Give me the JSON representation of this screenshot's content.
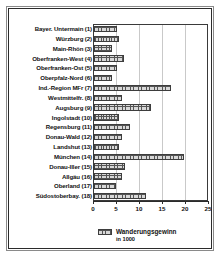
{
  "chart_data": {
    "type": "bar",
    "orientation": "horizontal",
    "title": "",
    "xlabel": "",
    "ylabel": "",
    "xlim": [
      0,
      25
    ],
    "xticks": [
      "0",
      "5",
      "10",
      "15",
      "20",
      "25"
    ],
    "grid": true,
    "legend": {
      "position": "bottom",
      "label": "Wanderungsgewinn",
      "sublabel": "in 1000"
    },
    "categories": [
      "Bayer. Untermain (1)",
      "Würzburg (2)",
      "Main-Rhön (3)",
      "Oberfranken-West (4)",
      "Oberfranken-Ost (5)",
      "Oberpfalz-Nord (6)",
      "Ind.-Region MFr (7)",
      "Westmittelfr. (8)",
      "Augsburg (9)",
      "Ingolstadt (10)",
      "Regensburg (11)",
      "Donau-Wald (12)",
      "Landshut (13)",
      "München (14)",
      "Donau-Iller (15)",
      "Allgäu (16)",
      "Oberland (17)",
      "Südostoberbay. (18)"
    ],
    "values": [
      5.0,
      5.5,
      4.0,
      6.5,
      5.0,
      4.0,
      16.8,
      6.0,
      12.3,
      5.5,
      7.8,
      6.0,
      5.5,
      19.6,
      6.8,
      6.0,
      4.8,
      11.3
    ],
    "series": [
      {
        "name": "Wanderungsgewinn",
        "values": [
          5.0,
          5.5,
          4.0,
          6.5,
          5.0,
          4.0,
          16.8,
          6.0,
          12.3,
          5.5,
          7.8,
          6.0,
          5.5,
          19.6,
          6.8,
          6.0,
          4.8,
          11.3
        ]
      }
    ],
    "colors": {
      "bar_fill": "#d8d8d8",
      "bar_edge": "#3d3d3d",
      "grid": "#c9c9c9",
      "axis": "#2b2b2b",
      "text": "#111111",
      "background": "#ffffff"
    }
  }
}
